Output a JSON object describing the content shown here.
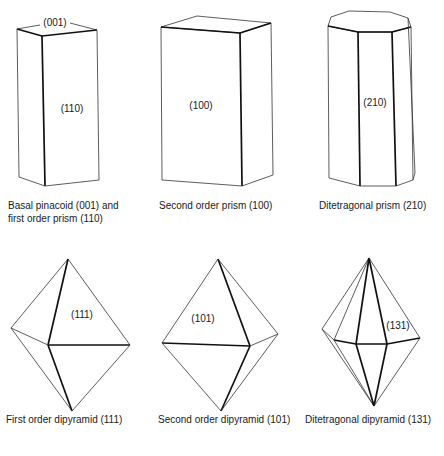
{
  "figures": [
    {
      "name": "basal-pinacoid-first-order-prism",
      "face_labels": [
        "(001)",
        "(110)"
      ],
      "caption_lines": [
        "Basal pinacoid (001) and",
        "first order prism (110)"
      ]
    },
    {
      "name": "second-order-prism",
      "face_labels": [
        "(100)"
      ],
      "caption_lines": [
        "Second order prism (100)"
      ]
    },
    {
      "name": "ditetragonal-prism",
      "face_labels": [
        "(210)"
      ],
      "caption_lines": [
        "Ditetragonal prism (210)"
      ]
    },
    {
      "name": "first-order-dipyramid",
      "face_labels": [
        "(111)"
      ],
      "caption_lines": [
        "First order dipyramid (111)"
      ]
    },
    {
      "name": "second-order-dipyramid",
      "face_labels": [
        "(101)"
      ],
      "caption_lines": [
        "Second order dipyramid (101)"
      ]
    },
    {
      "name": "ditetragonal-dipyramid",
      "face_labels": [
        "(131)"
      ],
      "caption_lines": [
        "Ditetragonal dipyramid (131)"
      ]
    }
  ]
}
